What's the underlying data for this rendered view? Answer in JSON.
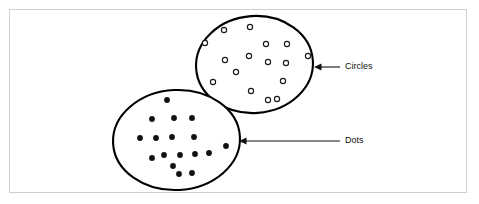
{
  "figure": {
    "background_color": "#ffffff",
    "frame_color": "#cfcfcf",
    "ink_color": "#111111"
  },
  "chart_data": {
    "type": "scatter",
    "title": "",
    "subtitle": "",
    "xlabel": "",
    "ylabel": "",
    "grid": false,
    "legend_position": "callout-labels-right",
    "groups": [
      {
        "name": "Circles",
        "marker": "hollow-circle",
        "marker_radius": 2.6,
        "marker_fill": "#ffffff",
        "marker_stroke": "#1a1a1a",
        "outline": {
          "cx": 254.5,
          "cy": 64.5,
          "rx": 58.5,
          "ry": 48.5,
          "rotation": -4
        },
        "count": 16,
        "points": [
          [
            224,
            30
          ],
          [
            250,
            27
          ],
          [
            205,
            43
          ],
          [
            266,
            44
          ],
          [
            287,
            44
          ],
          [
            249,
            56
          ],
          [
            308,
            56
          ],
          [
            225,
            60
          ],
          [
            268,
            62
          ],
          [
            286,
            63
          ],
          [
            213,
            82
          ],
          [
            283,
            81
          ],
          [
            251,
            91
          ],
          [
            268,
            100
          ],
          [
            277,
            99
          ],
          [
            236,
            72
          ]
        ]
      },
      {
        "name": "Dots",
        "marker": "filled-dot",
        "marker_radius": 2.9,
        "marker_fill": "#111111",
        "marker_stroke": "none",
        "outline": {
          "cx": 176.5,
          "cy": 140.0,
          "rx": 63.5,
          "ry": 50.0,
          "rotation": -3
        },
        "count": 17,
        "points": [
          [
            167,
            100
          ],
          [
            152,
            119
          ],
          [
            174,
            118
          ],
          [
            192,
            118
          ],
          [
            140,
            138
          ],
          [
            156,
            138
          ],
          [
            172,
            137
          ],
          [
            194,
            137
          ],
          [
            226,
            146
          ],
          [
            164,
            155
          ],
          [
            180,
            155
          ],
          [
            195,
            154
          ],
          [
            173,
            166
          ],
          [
            152,
            158
          ],
          [
            179,
            174
          ],
          [
            192,
            173
          ],
          [
            209,
            153
          ]
        ]
      }
    ],
    "annotations": [
      {
        "label": "Circles",
        "target_group": "Circles",
        "arrow_tip": {
          "x": 314,
          "y": 67
        },
        "arrow_tail": {
          "x": 340,
          "y": 67
        },
        "text_anchor": {
          "x": 345,
          "y": 67
        }
      },
      {
        "label": "Dots",
        "target_group": "Dots",
        "arrow_tip": {
          "x": 239,
          "y": 141
        },
        "arrow_tail": {
          "x": 340,
          "y": 141
        },
        "text_anchor": {
          "x": 345,
          "y": 141
        }
      }
    ]
  }
}
